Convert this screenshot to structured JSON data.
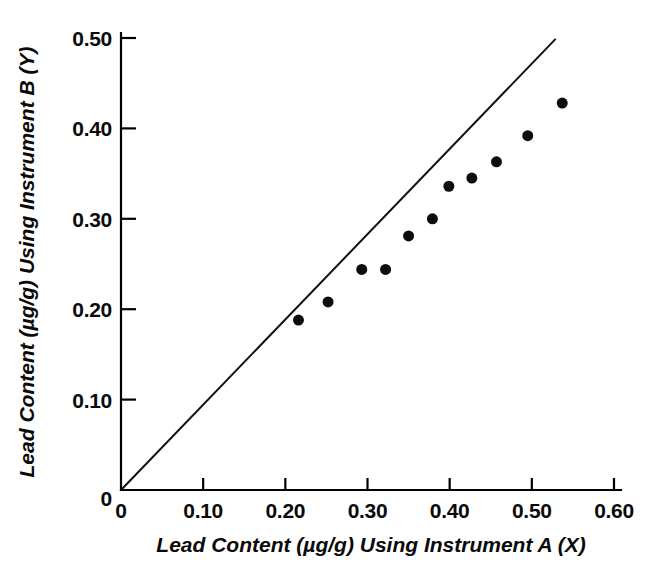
{
  "chart_data": {
    "type": "scatter",
    "title": "",
    "xlabel": "Lead Content (µg/g) Using Instrument A (X)",
    "ylabel": "Lead Content (µg/g) Using Instrument B (Y)",
    "xlim": [
      0,
      0.6
    ],
    "ylim": [
      0,
      0.5
    ],
    "xticks": [
      0,
      0.1,
      0.2,
      0.3,
      0.4,
      0.5,
      0.6
    ],
    "xtick_labels": [
      "0",
      "0.10",
      "0.20",
      "0.30",
      "0.40",
      "0.50",
      "0.60"
    ],
    "yticks": [
      0,
      0.1,
      0.2,
      0.3,
      0.4,
      0.5
    ],
    "ytick_labels": [
      "0",
      "0.10",
      "0.20",
      "0.30",
      "0.40",
      "0.50"
    ],
    "grid": false,
    "legend": false,
    "marker": "filled-circle",
    "marker_color": "#0d0d0d",
    "marker_size_px": 11,
    "series": [
      {
        "name": "Paired instrument measurements",
        "x": [
          0.216,
          0.252,
          0.293,
          0.322,
          0.35,
          0.379,
          0.399,
          0.427,
          0.457,
          0.495,
          0.537
        ],
        "y": [
          0.188,
          0.208,
          0.244,
          0.244,
          0.281,
          0.3,
          0.336,
          0.345,
          0.363,
          0.392,
          0.428
        ]
      }
    ],
    "reference_line": {
      "name": "identity line (Y = X)",
      "x": [
        0.0,
        0.529
      ],
      "y": [
        0.0,
        0.499
      ],
      "color": "#111111"
    }
  }
}
